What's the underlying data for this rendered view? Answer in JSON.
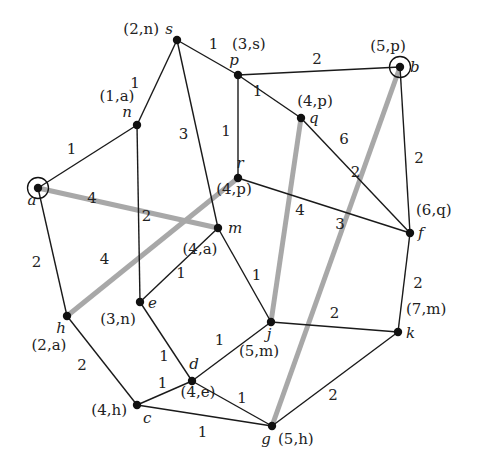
{
  "diagram": {
    "type": "weighted-graph",
    "nodes": [
      {
        "id": "s",
        "label": "s",
        "tag": "(2,n)",
        "x": 177,
        "y": 40
      },
      {
        "id": "p",
        "label": "p",
        "tag": "(3,s)",
        "x": 238,
        "y": 75
      },
      {
        "id": "b",
        "label": "b",
        "tag": "(5,p)",
        "x": 400,
        "y": 67,
        "circled": true
      },
      {
        "id": "n",
        "label": "n",
        "tag": "(1,a)",
        "x": 137,
        "y": 125
      },
      {
        "id": "q",
        "label": "q",
        "tag": "(4,p)",
        "x": 301,
        "y": 118
      },
      {
        "id": "a",
        "label": "a",
        "tag": "",
        "x": 38,
        "y": 188,
        "circled": true
      },
      {
        "id": "r",
        "label": "r",
        "tag": "(4,p)",
        "x": 238,
        "y": 178
      },
      {
        "id": "m",
        "label": "m",
        "tag": "(4,a)",
        "x": 218,
        "y": 228
      },
      {
        "id": "f",
        "label": "f",
        "tag": "(6,q)",
        "x": 410,
        "y": 233
      },
      {
        "id": "e",
        "label": "e",
        "tag": "(3,n)",
        "x": 140,
        "y": 302
      },
      {
        "id": "h",
        "label": "h",
        "tag": "(2,a)",
        "x": 67,
        "y": 316
      },
      {
        "id": "j",
        "label": "j",
        "tag": "(5,m)",
        "x": 271,
        "y": 322
      },
      {
        "id": "k",
        "label": "k",
        "tag": "(7,m)",
        "x": 398,
        "y": 332
      },
      {
        "id": "d",
        "label": "d",
        "tag": "(4,e)",
        "x": 192,
        "y": 381
      },
      {
        "id": "c",
        "label": "c",
        "tag": "(4,h)",
        "x": 137,
        "y": 405
      },
      {
        "id": "g",
        "label": "g",
        "tag": "(5,h)",
        "x": 272,
        "y": 426
      }
    ],
    "edges": [
      {
        "from": "s",
        "to": "n",
        "weight": "1",
        "highlighted": false
      },
      {
        "from": "s",
        "to": "p",
        "weight": "1",
        "highlighted": false
      },
      {
        "from": "s",
        "to": "m",
        "weight": "3",
        "highlighted": false
      },
      {
        "from": "n",
        "to": "a",
        "weight": "1",
        "highlighted": false
      },
      {
        "from": "n",
        "to": "e",
        "weight": "2",
        "highlighted": false
      },
      {
        "from": "p",
        "to": "b",
        "weight": "2",
        "highlighted": false
      },
      {
        "from": "p",
        "to": "q",
        "weight": "1",
        "highlighted": false
      },
      {
        "from": "p",
        "to": "r",
        "weight": "1",
        "highlighted": false
      },
      {
        "from": "q",
        "to": "f",
        "weight": "2",
        "highlighted": false
      },
      {
        "from": "b",
        "to": "f",
        "weight": "2",
        "highlighted": false
      },
      {
        "from": "r",
        "to": "f",
        "weight": "3",
        "highlighted": false
      },
      {
        "from": "a",
        "to": "h",
        "weight": "2",
        "highlighted": false
      },
      {
        "from": "m",
        "to": "e",
        "weight": "1",
        "highlighted": false
      },
      {
        "from": "m",
        "to": "j",
        "weight": "1",
        "highlighted": false
      },
      {
        "from": "e",
        "to": "d",
        "weight": "1",
        "highlighted": false
      },
      {
        "from": "h",
        "to": "c",
        "weight": "2",
        "highlighted": false
      },
      {
        "from": "c",
        "to": "d",
        "weight": "1",
        "highlighted": false
      },
      {
        "from": "c",
        "to": "g",
        "weight": "1",
        "highlighted": false
      },
      {
        "from": "d",
        "to": "j",
        "weight": "1",
        "highlighted": false
      },
      {
        "from": "d",
        "to": "g",
        "weight": "1",
        "highlighted": false
      },
      {
        "from": "j",
        "to": "k",
        "weight": "2",
        "highlighted": false
      },
      {
        "from": "f",
        "to": "k",
        "weight": "2",
        "highlighted": false
      },
      {
        "from": "k",
        "to": "g",
        "weight": "2",
        "highlighted": false
      },
      {
        "from": "a",
        "to": "m",
        "weight": "4",
        "highlighted": true
      },
      {
        "from": "h",
        "to": "r",
        "weight": "4",
        "highlighted": true
      },
      {
        "from": "q",
        "to": "j",
        "weight": "4",
        "highlighted": true
      },
      {
        "from": "b",
        "to": "g",
        "weight": "6",
        "highlighted": true
      }
    ],
    "colors": {
      "edge": "#1a1a1a",
      "highlighted_edge": "#a8a8a8",
      "node": "#111111",
      "text": "#222222"
    }
  }
}
